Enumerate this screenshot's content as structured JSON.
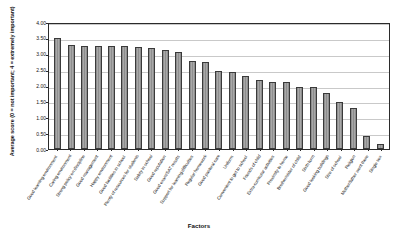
{
  "chart_data": {
    "type": "bar",
    "title": "",
    "xlabel": "Factors",
    "ylabel": "Average score (0 = not important; 4 = extremely important)",
    "ylim": [
      0,
      4
    ],
    "ytick_labels": [
      "0.00",
      "0.50",
      "1.00",
      "1.50",
      "2.00",
      "2.50",
      "3.00",
      "3.50",
      "4.00"
    ],
    "ytick_values": [
      0,
      0.5,
      1.0,
      1.5,
      2.0,
      2.5,
      3.0,
      3.5,
      4.0
    ],
    "grid": true,
    "legend": "none",
    "bar_color": "#9a9a9a",
    "bar_edge_color": "#3a3a3a",
    "categories": [
      "Good learning environment",
      "Caring environment",
      "Strong policy on discipline",
      "Good management",
      "Happy environment",
      "Good facilities in school",
      "Plenty of resources for students",
      "Safety in school",
      "Good reputation",
      "Good exam/SAT results",
      "Support for learning difficulties",
      "Regular homework",
      "Good pastoral care",
      "Uniform",
      "Convenient to get to school",
      "Friends of child",
      "Extra-curricular activities",
      "Proximity to home",
      "Brother/sister of child",
      "Sixth form",
      "Good looking buildings",
      "Size of school",
      "Religion",
      "Mother/father went there",
      "Single sex"
    ],
    "values": [
      3.5,
      3.28,
      3.25,
      3.25,
      3.24,
      3.23,
      3.21,
      3.18,
      3.11,
      3.06,
      2.77,
      2.74,
      2.46,
      2.42,
      2.3,
      2.18,
      2.12,
      2.11,
      1.95,
      1.95,
      1.76,
      1.49,
      1.3,
      0.4,
      0.15
    ]
  }
}
